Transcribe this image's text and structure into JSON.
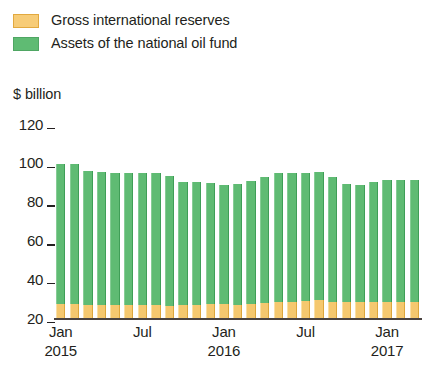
{
  "legend": {
    "items": [
      {
        "label": "Gross international reserves",
        "color": "#F5C86F",
        "key": "reserves"
      },
      {
        "label": "Assets of the national oil fund",
        "color": "#5FBB73",
        "key": "oilfund"
      }
    ]
  },
  "axis_title": "$ billion",
  "chart_data": {
    "type": "bar",
    "stacked": true,
    "title": "",
    "subtitle": "",
    "xlabel": "",
    "ylabel": "$ billion",
    "ylim": [
      20,
      120
    ],
    "yticks": [
      20,
      40,
      60,
      80,
      100,
      120
    ],
    "ytick_labels": [
      "20",
      "40",
      "60",
      "80",
      "100",
      "120"
    ],
    "grid": false,
    "legend_position": "top-left",
    "x": [
      "Jan 2015",
      "Feb 2015",
      "Mar 2015",
      "Apr 2015",
      "May 2015",
      "Jun 2015",
      "Jul 2015",
      "Aug 2015",
      "Sep 2015",
      "Oct 2015",
      "Nov 2015",
      "Dec 2015",
      "Jan 2016",
      "Feb 2016",
      "Mar 2016",
      "Apr 2016",
      "May 2016",
      "Jun 2016",
      "Jul 2016",
      "Aug 2016",
      "Sep 2016",
      "Oct 2016",
      "Nov 2016",
      "Dec 2016",
      "Jan 2017",
      "Feb 2017",
      "Mar 2017"
    ],
    "xtick_labels": [
      {
        "month": "Jan",
        "year": "2015",
        "index": 0
      },
      {
        "month": "Jul",
        "year": "",
        "index": 6
      },
      {
        "month": "Jan",
        "year": "2016",
        "index": 12
      },
      {
        "month": "Jul",
        "year": "",
        "index": 18
      },
      {
        "month": "Jan",
        "year": "2017",
        "index": 24
      }
    ],
    "series": [
      {
        "name": "Gross international reserves",
        "color": "#F5C86F",
        "values": [
          27.0,
          27.0,
          26.5,
          26.5,
          26.5,
          26.5,
          26.5,
          26.5,
          26.0,
          26.5,
          26.5,
          27.0,
          27.0,
          26.5,
          27.0,
          27.5,
          28.0,
          28.5,
          29.0,
          29.5,
          28.5,
          28.0,
          28.0,
          28.5,
          28.0,
          28.5,
          28.5
        ]
      },
      {
        "name": "Assets of the national oil fund",
        "color": "#5FBB73",
        "values": [
          72.5,
          72.5,
          69.5,
          69.0,
          68.0,
          68.0,
          68.5,
          68.5,
          67.0,
          63.5,
          63.5,
          62.5,
          61.5,
          62.5,
          63.5,
          65.0,
          66.5,
          66.0,
          66.0,
          66.0,
          64.0,
          61.0,
          60.5,
          61.5,
          63.0,
          62.5,
          62.5
        ]
      }
    ],
    "totals": [
      99.5,
      99.5,
      96.0,
      95.5,
      94.5,
      94.5,
      95.0,
      95.0,
      93.0,
      90.0,
      90.0,
      89.5,
      88.5,
      89.0,
      90.5,
      92.5,
      94.5,
      94.5,
      95.0,
      95.5,
      92.5,
      89.0,
      88.5,
      90.0,
      91.0,
      91.0,
      91.0
    ]
  }
}
